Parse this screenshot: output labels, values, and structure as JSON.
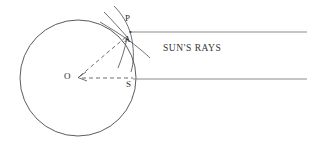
{
  "figure": {
    "background_color": "#ffffff",
    "stroke_color": "#4a4a4a",
    "ray_color": "#8c8c8c",
    "label_color": "#2b2b2b",
    "width": 319,
    "height": 152
  },
  "labels": {
    "point_P": "P",
    "point_A": "A",
    "point_O": "O",
    "point_S": "S",
    "sun_rays": "SUN'S RAYS"
  },
  "geometry": {
    "circle": {
      "name": "earth-circle",
      "cx": 78,
      "cy": 78,
      "r": 58
    },
    "rays": [
      {
        "name": "upper-sun-ray",
        "x1": 130,
        "y1": 32,
        "x2": 307,
        "y2": 32
      },
      {
        "name": "lower-sun-ray",
        "x1": 133,
        "y1": 79,
        "x2": 307,
        "y2": 79
      }
    ],
    "dashed_lines": [
      {
        "name": "radius-O-to-A",
        "x1": 78,
        "y1": 78,
        "x2": 127,
        "y2": 36
      },
      {
        "name": "radius-O-to-S",
        "x1": 78,
        "y1": 78,
        "x2": 133,
        "y2": 78
      }
    ],
    "construction_arcs": [
      {
        "name": "arc-upper-left-sweep"
      },
      {
        "name": "arc-upper-right-sweep"
      }
    ],
    "points": [
      {
        "name": "point-P",
        "x": 130,
        "y": 32
      },
      {
        "name": "point-A",
        "x": 127,
        "y": 39
      },
      {
        "name": "point-O",
        "x": 78,
        "y": 78
      },
      {
        "name": "point-S",
        "x": 133,
        "y": 78
      }
    ]
  }
}
